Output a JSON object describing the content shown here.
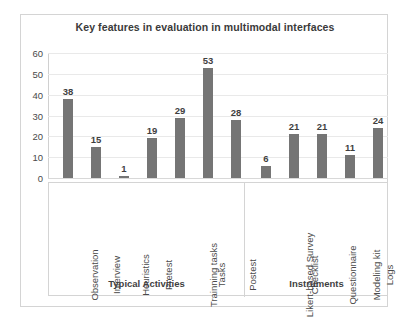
{
  "chart_data": {
    "type": "bar",
    "title": "Key features in evaluation in multimodal interfaces",
    "xlabel": "",
    "ylabel": "",
    "ylim": [
      0,
      60
    ],
    "yticks": [
      0,
      10,
      20,
      30,
      40,
      50,
      60
    ],
    "grid": true,
    "legend": null,
    "bar_color": "#757575",
    "categories": [
      "Observation",
      "Interview",
      "Heuristics",
      "Pretest",
      "Trainning tasks",
      "Tasks",
      "Postest",
      "Likert-based Survey",
      "Checklist",
      "Questionnaire",
      "Modeling kit",
      "Logs"
    ],
    "values": [
      38,
      15,
      1,
      19,
      29,
      53,
      28,
      6,
      21,
      21,
      11,
      24
    ],
    "data_labels": [
      "38",
      "15",
      "1",
      "19",
      "29",
      "53",
      "28",
      "6",
      "21",
      "21",
      "11",
      "24"
    ],
    "groups": [
      {
        "label": "Typical Activities",
        "start": 0,
        "count": 7
      },
      {
        "label": "Instruments",
        "start": 7,
        "count": 5
      }
    ]
  }
}
